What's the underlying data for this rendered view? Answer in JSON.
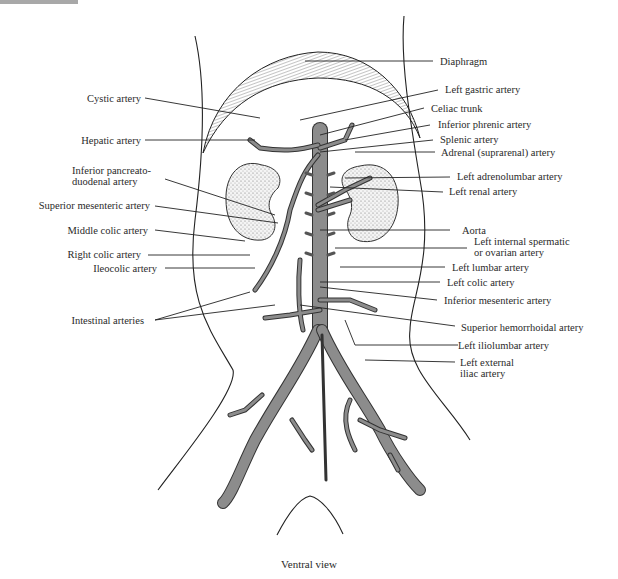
{
  "figure": {
    "caption": "Ventral view",
    "vessel_color": "#7f7f7f",
    "outline_color": "#222222"
  },
  "labels_left": {
    "cystic_artery": "Cystic artery",
    "hepatic_artery": "Hepatic artery",
    "inferior_pancreatoduodenal_1": "Inferior pancreato-",
    "inferior_pancreatoduodenal_2": "duodenal artery",
    "superior_mesenteric_artery": "Superior mesenteric artery",
    "middle_colic_artery": "Middle colic artery",
    "right_colic_artery": "Right colic artery",
    "ileocolic_artery": "Ileocolic artery",
    "intestinal_arteries": "Intestinal arteries"
  },
  "labels_right": {
    "diaphragm": "Diaphragm",
    "left_gastric_artery": "Left gastric artery",
    "celiac_trunk": "Celiac trunk",
    "inferior_phrenic_artery": "Inferior phrenic artery",
    "splenic_artery": "Splenic artery",
    "adrenal_artery": "Adrenal (suprarenal) artery",
    "left_adrenolumbar_artery": "Left adrenolumbar artery",
    "left_renal_artery": "Left renal artery",
    "aorta": "Aorta",
    "left_internal_spermatic_1": "Left internal spermatic",
    "left_internal_spermatic_2": "or ovarian artery",
    "left_lumbar_artery": "Left lumbar artery",
    "left_colic_artery": "Left colic artery",
    "inferior_mesenteric_artery": "Inferior mesenteric artery",
    "superior_hemorrhoidal_artery": "Superior hemorrhoidal artery",
    "left_iliolumbar_artery": "Left iliolumbar artery",
    "left_external_iliac_1": "Left external",
    "left_external_iliac_2": "iliac artery"
  }
}
